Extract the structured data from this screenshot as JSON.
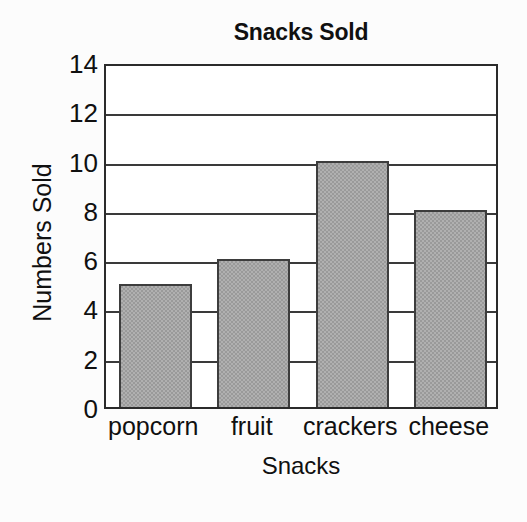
{
  "chart_data": {
    "type": "bar",
    "title": "Snacks Sold",
    "xlabel": "Snacks",
    "ylabel": "Numbers Sold",
    "categories": [
      "popcorn",
      "fruit",
      "crackers",
      "cheese"
    ],
    "values": [
      5,
      6,
      10,
      8
    ],
    "ylim": [
      0,
      14
    ],
    "ytick_step": 2,
    "yticks": [
      14,
      12,
      10,
      8,
      6,
      4,
      2,
      0
    ],
    "ytick_labels": [
      "14",
      "12",
      "10",
      "8",
      "6",
      "4",
      "2",
      "0"
    ],
    "grid": true,
    "grid_axis": "y",
    "legend": false,
    "legend_position": "none",
    "bar_color": "#9a9a9a",
    "bar_edge_color": "#3d3d3d",
    "axis_color": "#2b2b2b",
    "background_color": "#fcfcfc",
    "plot_background_color": "#ffffff",
    "text_color": "#101010"
  }
}
